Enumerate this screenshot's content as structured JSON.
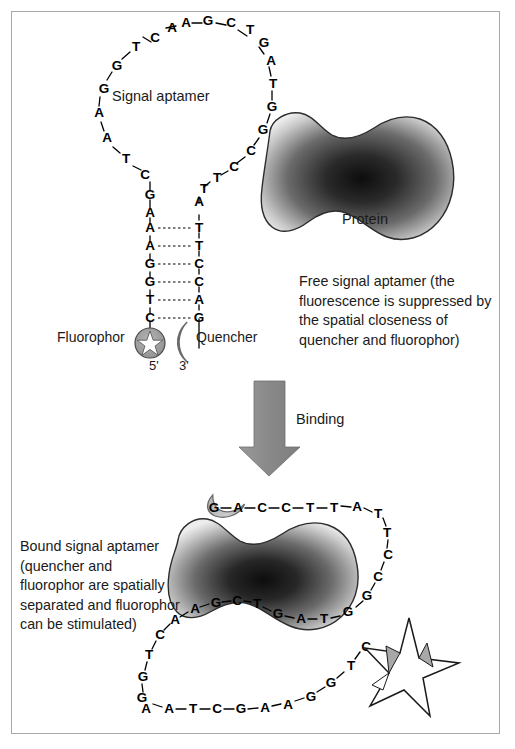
{
  "figure": {
    "title_present": false,
    "border_color": "#a8a8a8",
    "background": "#ffffff"
  },
  "labels": {
    "signal_aptamer": "Signal aptamer",
    "protein": "Protein",
    "fluorophor": "Fluorophor",
    "quencher": "Quencher",
    "five_prime": "5'",
    "three_prime": "3'",
    "binding": "Binding"
  },
  "captions": {
    "free_aptamer": "Free signal aptamer (the fluorescence is suppressed by the spatial closeness of quencher and fluorophor)",
    "bound_aptamer": "Bound signal aptamer (quencher and fluorophor are spatially separated and fluorophor can be stimulated)"
  },
  "colors": {
    "protein_dark": "#1a1a1a",
    "protein_light": "#dedede",
    "quencher_fill": "#b3b3b3",
    "fluorophor_fill": "#9e9e9e",
    "arrow_fill": "#8c8c8c",
    "star_fill": "#ffffff",
    "star_stroke": "#1a1a1a",
    "base_text": "#000000",
    "label_text": "#1a1a1a"
  },
  "free_aptamer": {
    "loop_left_sequence": [
      "C",
      "T",
      "G",
      "G",
      "A",
      "A",
      "T",
      "C",
      "G",
      "A"
    ],
    "loop_top_sequence": [
      "A",
      "A",
      "G",
      "C",
      "T",
      "G"
    ],
    "loop_right_sequence": [
      "A",
      "T",
      "G",
      "G",
      "C",
      "C",
      "T",
      "T",
      "A"
    ],
    "stem_left_sequence": [
      "A",
      "A",
      "G",
      "G",
      "T",
      "C"
    ],
    "stem_right_sequence": [
      "T",
      "T",
      "C",
      "C",
      "A",
      "G"
    ],
    "loop_left_points": [
      [
        136,
        43
      ],
      [
        115,
        62
      ],
      [
        99,
        86
      ],
      [
        96,
        111
      ],
      [
        104,
        136
      ],
      [
        122,
        155
      ],
      [
        142,
        170
      ],
      [
        148,
        190
      ],
      [
        150,
        210
      ],
      [
        150,
        228
      ]
    ],
    "loop_top_points": [
      [
        160,
        30
      ],
      [
        185,
        24
      ],
      [
        209,
        23
      ],
      [
        232,
        27
      ],
      [
        253,
        40
      ]
    ],
    "loop_right_points": [
      [
        265,
        57
      ],
      [
        272,
        79
      ],
      [
        272,
        104
      ],
      [
        264,
        127
      ],
      [
        253,
        148
      ],
      [
        235,
        165
      ],
      [
        218,
        175
      ],
      [
        203,
        188
      ],
      [
        199,
        207
      ]
    ],
    "stem_left_points": [
      [
        150,
        228
      ],
      [
        150,
        246
      ],
      [
        150,
        264
      ],
      [
        150,
        282
      ],
      [
        150,
        300
      ],
      [
        150,
        318
      ]
    ],
    "stem_right_points": [
      [
        199,
        207
      ],
      [
        199,
        225
      ],
      [
        199,
        243
      ],
      [
        199,
        261
      ],
      [
        199,
        279
      ],
      [
        199,
        297
      ],
      [
        199,
        315
      ]
    ]
  },
  "bound_aptamer": {
    "top_sequence": [
      "G",
      "A",
      "C",
      "C",
      "T",
      "T",
      "A"
    ],
    "right_sequence": [
      "T",
      "T",
      "C",
      "C",
      "G"
    ],
    "middle_sequence": [
      "T",
      "C",
      "A",
      "A",
      "G",
      "C",
      "T",
      "G",
      "A",
      "T",
      "G"
    ],
    "left_sequence": [
      "T",
      "G",
      "G",
      "A"
    ],
    "bottom_sequence": [
      "A",
      "A",
      "T",
      "C",
      "G",
      "A",
      "A",
      "G",
      "G",
      "T",
      "C"
    ]
  },
  "icons": {
    "fluorophor_quenched": "star-in-circle-icon",
    "quencher": "crescent-icon",
    "binding_arrow": "down-arrow-icon",
    "fluorophor_emitting": "star-burst-icon",
    "protein": "protein-blob-icon"
  }
}
